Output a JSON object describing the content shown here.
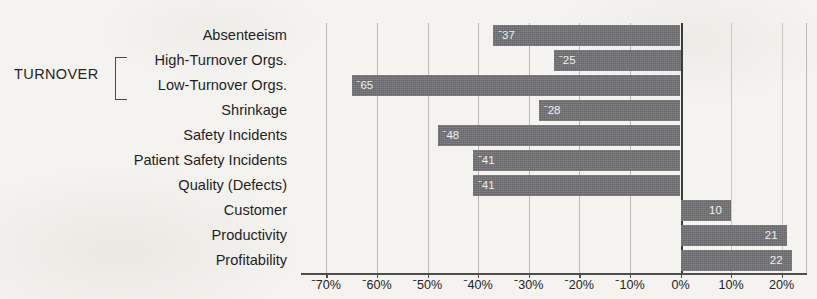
{
  "group": {
    "label": "TURNOVER",
    "bracket_rows": [
      1,
      2
    ]
  },
  "chart_data": {
    "type": "bar",
    "orientation": "horizontal",
    "title": "",
    "xlabel": "",
    "ylabel": "",
    "xlim": [
      -75,
      25
    ],
    "xticks": [
      -70,
      -60,
      -50,
      -40,
      -30,
      -20,
      -10,
      0,
      10,
      20
    ],
    "xticklabels": [
      "ˉ70%",
      "ˉ60%",
      "ˉ50%",
      "ˉ40%",
      "ˉ30%",
      "ˉ20%",
      "ˉ10%",
      "0%",
      "10%",
      "20%"
    ],
    "grid": true,
    "legend": false,
    "bar_color": "#67666a",
    "categories": [
      "Absenteeism",
      "High-Turnover Orgs.",
      "Low-Turnover Orgs.",
      "Shrinkage",
      "Safety Incidents",
      "Patient Safety Incidents",
      "Quality (Defects)",
      "Customer",
      "Productivity",
      "Profitability"
    ],
    "values": [
      -37,
      -25,
      -65,
      -28,
      -48,
      -41,
      -41,
      10,
      21,
      22
    ],
    "datalabels": [
      "ˉ37",
      "ˉ25",
      "ˉ65",
      "ˉ28",
      "ˉ48",
      "ˉ41",
      "ˉ41",
      "10",
      "21",
      "22"
    ]
  }
}
